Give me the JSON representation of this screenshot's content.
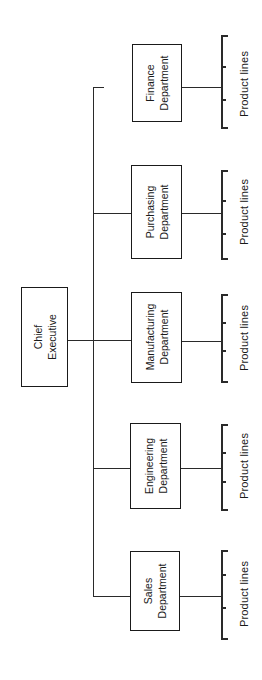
{
  "diagram": {
    "type": "organization-chart",
    "orientation": "rotated-90-ccw",
    "root": {
      "line1": "Chief",
      "line2": "Executive"
    },
    "departments": [
      {
        "line1": "Finance",
        "line2": "Department",
        "sub_label": "Product lines",
        "connected_to_bus": false
      },
      {
        "line1": "Purchasing",
        "line2": "Department",
        "sub_label": "Product lines",
        "connected_to_bus": true
      },
      {
        "line1": "Manufacturing",
        "line2": "Department",
        "sub_label": "Product lines",
        "connected_to_bus": true
      },
      {
        "line1": "Engineering",
        "line2": "Department",
        "sub_label": "Product lines",
        "connected_to_bus": true
      },
      {
        "line1": "Sales",
        "line2": "Department",
        "sub_label": "Product lines",
        "connected_to_bus": true
      }
    ]
  }
}
